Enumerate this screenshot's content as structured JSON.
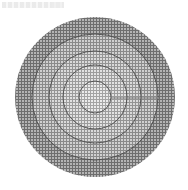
{
  "figure": {
    "center": {
      "x": 95,
      "y": 97
    },
    "rings": [
      {
        "radius": 80,
        "grid_color": "#6e6e6e",
        "fill": "#b4b4b4"
      },
      {
        "radius": 63,
        "grid_color": "#8a8a8a",
        "fill": "#d0d0d0"
      },
      {
        "radius": 46,
        "grid_color": "#949494",
        "fill": "#dadada"
      },
      {
        "radius": 32,
        "grid_color": "#9c9c9c",
        "fill": "#e2e2e2"
      },
      {
        "radius": 16,
        "grid_color": "#a4a4a4",
        "fill": "#ebebeb"
      }
    ],
    "ring_stroke_color": "#4a4a4a",
    "grid_pitch": 3
  }
}
